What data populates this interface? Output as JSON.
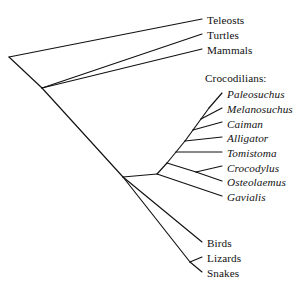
{
  "figure": {
    "type": "cladogram",
    "background_color": "#ffffff",
    "line_color": "#111111",
    "width": 304,
    "height": 286
  },
  "group_headers": [
    {
      "text": "Crocodilians:",
      "x": 205,
      "y": 73
    }
  ],
  "tips": [
    {
      "id": "teleosts",
      "label": "Teleosts",
      "italic": false,
      "label_x": 207,
      "label_y": 15,
      "tip_x": 202,
      "tip_y": 19
    },
    {
      "id": "turtles",
      "label": "Turtles",
      "italic": false,
      "label_x": 207,
      "label_y": 30,
      "tip_x": 202,
      "tip_y": 34
    },
    {
      "id": "mammals",
      "label": "Mammals",
      "italic": false,
      "label_x": 207,
      "label_y": 45,
      "tip_x": 202,
      "tip_y": 49
    },
    {
      "id": "paleosuchus",
      "label": "Paleosuchus",
      "italic": true,
      "label_x": 227,
      "label_y": 89,
      "tip_x": 222,
      "tip_y": 93
    },
    {
      "id": "melanosuchus",
      "label": "Melanosuchus",
      "italic": true,
      "label_x": 227,
      "label_y": 104,
      "tip_x": 222,
      "tip_y": 108
    },
    {
      "id": "caiman",
      "label": "Caiman",
      "italic": true,
      "label_x": 227,
      "label_y": 119,
      "tip_x": 222,
      "tip_y": 122
    },
    {
      "id": "alligator",
      "label": "Alligator",
      "italic": true,
      "label_x": 227,
      "label_y": 133,
      "tip_x": 222,
      "tip_y": 137
    },
    {
      "id": "tomistoma",
      "label": "Tomistoma",
      "italic": true,
      "label_x": 227,
      "label_y": 148,
      "tip_x": 222,
      "tip_y": 152
    },
    {
      "id": "crocodylus",
      "label": "Crocodylus",
      "italic": true,
      "label_x": 227,
      "label_y": 163,
      "tip_x": 222,
      "tip_y": 166
    },
    {
      "id": "osteolaemus",
      "label": "Osteolaemus",
      "italic": true,
      "label_x": 227,
      "label_y": 177,
      "tip_x": 222,
      "tip_y": 181
    },
    {
      "id": "gavialis",
      "label": "Gavialis",
      "italic": true,
      "label_x": 227,
      "label_y": 192,
      "tip_x": 222,
      "tip_y": 196
    },
    {
      "id": "birds",
      "label": "Birds",
      "italic": false,
      "label_x": 207,
      "label_y": 238,
      "tip_x": 202,
      "tip_y": 242
    },
    {
      "id": "lizards",
      "label": "Lizards",
      "italic": false,
      "label_x": 207,
      "label_y": 253,
      "tip_x": 202,
      "tip_y": 257
    },
    {
      "id": "snakes",
      "label": "Snakes",
      "italic": false,
      "label_x": 207,
      "label_y": 268,
      "tip_x": 202,
      "tip_y": 272
    }
  ],
  "nodes": [
    {
      "id": "root",
      "x": 9,
      "y": 57
    },
    {
      "id": "amniote-split",
      "x": 42,
      "y": 88
    },
    {
      "id": "reptile-split",
      "x": 123,
      "y": 177
    },
    {
      "id": "croc-crown",
      "x": 157,
      "y": 174
    },
    {
      "id": "croc-n1",
      "x": 167,
      "y": 163
    },
    {
      "id": "croc-n2",
      "x": 176,
      "y": 152
    },
    {
      "id": "croc-n3",
      "x": 185,
      "y": 141
    },
    {
      "id": "croc-n4",
      "x": 193,
      "y": 130
    },
    {
      "id": "croc-n5",
      "x": 201,
      "y": 119
    },
    {
      "id": "croc-n6",
      "x": 209,
      "y": 108
    },
    {
      "id": "crocodylus-node",
      "x": 196,
      "y": 172
    },
    {
      "id": "squamate-node",
      "x": 190,
      "y": 262
    }
  ],
  "branches": [
    {
      "id": "root-to-teleosts",
      "points": "9,57 202,19"
    },
    {
      "id": "root-to-amniote",
      "points": "9,57 42,88"
    },
    {
      "id": "amniote-to-turtles",
      "points": "42,88 202,34"
    },
    {
      "id": "amniote-to-mammals",
      "points": "42,88 202,49"
    },
    {
      "id": "amniote-to-reptile",
      "points": "42,88 123,177"
    },
    {
      "id": "reptile-to-croc-crown",
      "points": "123,177 157,174"
    },
    {
      "id": "reptile-to-birds",
      "points": "123,177 202,242"
    },
    {
      "id": "reptile-to-squamate",
      "points": "123,177 190,262"
    },
    {
      "id": "squamate-to-lizards",
      "points": "190,262 202,257"
    },
    {
      "id": "squamate-to-snakes",
      "points": "190,262 202,272"
    },
    {
      "id": "croc-crown-to-gavialis",
      "points": "157,174 222,196"
    },
    {
      "id": "croc-crown-to-n1",
      "points": "157,174 167,163"
    },
    {
      "id": "n1-to-crocodylus-node",
      "points": "167,163 196,172"
    },
    {
      "id": "crocnode-to-crocodylus",
      "points": "196,172 222,166"
    },
    {
      "id": "crocnode-to-osteolaemus",
      "points": "196,172 222,181"
    },
    {
      "id": "n1-to-n2",
      "points": "167,163 176,152"
    },
    {
      "id": "n2-to-tomistoma",
      "points": "176,152 222,152"
    },
    {
      "id": "n2-to-n3",
      "points": "176,152 185,141"
    },
    {
      "id": "n3-to-alligator",
      "points": "185,141 222,137"
    },
    {
      "id": "n3-to-n4",
      "points": "185,141 193,130"
    },
    {
      "id": "n4-to-caiman",
      "points": "193,130 222,122"
    },
    {
      "id": "n4-to-n5",
      "points": "193,130 201,119"
    },
    {
      "id": "n5-to-melanosuchus",
      "points": "201,119 222,108"
    },
    {
      "id": "n5-to-n6",
      "points": "201,119 209,108"
    },
    {
      "id": "n6-to-paleosuchus",
      "points": "209,108 222,93"
    }
  ]
}
